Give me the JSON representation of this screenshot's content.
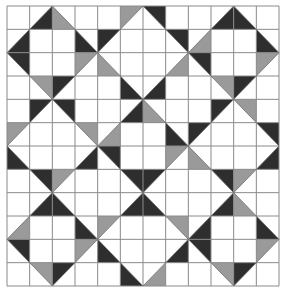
{
  "grid": {
    "rows": 12,
    "cols": 12
  },
  "colors": {
    "background": "#ffffff",
    "grid_line": "#8a8a8a",
    "dark": "#2e2e2e",
    "gray": "#9a9a9a",
    "outline": "#6e6e6e"
  },
  "triangles": [
    {
      "r": 0,
      "c": 1,
      "corner": "BR",
      "tone": "dark"
    },
    {
      "r": 0,
      "c": 2,
      "corner": "BL",
      "tone": "gray"
    },
    {
      "r": 0,
      "c": 5,
      "corner": "TL",
      "tone": "gray"
    },
    {
      "r": 0,
      "c": 6,
      "corner": "TR",
      "tone": "dark"
    },
    {
      "r": 0,
      "c": 9,
      "corner": "BR",
      "tone": "dark"
    },
    {
      "r": 0,
      "c": 10,
      "corner": "BL",
      "tone": "dark"
    },
    {
      "r": 1,
      "c": 0,
      "corner": "BR",
      "tone": "dark"
    },
    {
      "r": 1,
      "c": 3,
      "corner": "BL",
      "tone": "dark"
    },
    {
      "r": 1,
      "c": 4,
      "corner": "TL",
      "tone": "dark"
    },
    {
      "r": 1,
      "c": 7,
      "corner": "TR",
      "tone": "dark"
    },
    {
      "r": 1,
      "c": 8,
      "corner": "BR",
      "tone": "gray"
    },
    {
      "r": 1,
      "c": 11,
      "corner": "BL",
      "tone": "dark"
    },
    {
      "r": 2,
      "c": 0,
      "corner": "TR",
      "tone": "dark"
    },
    {
      "r": 2,
      "c": 3,
      "corner": "TL",
      "tone": "gray"
    },
    {
      "r": 2,
      "c": 4,
      "corner": "BL",
      "tone": "gray"
    },
    {
      "r": 2,
      "c": 7,
      "corner": "BR",
      "tone": "gray"
    },
    {
      "r": 2,
      "c": 8,
      "corner": "TR",
      "tone": "dark"
    },
    {
      "r": 2,
      "c": 11,
      "corner": "TL",
      "tone": "gray"
    },
    {
      "r": 3,
      "c": 1,
      "corner": "TR",
      "tone": "gray"
    },
    {
      "r": 3,
      "c": 2,
      "corner": "TL",
      "tone": "dark"
    },
    {
      "r": 3,
      "c": 5,
      "corner": "BL",
      "tone": "dark"
    },
    {
      "r": 3,
      "c": 6,
      "corner": "BR",
      "tone": "dark"
    },
    {
      "r": 3,
      "c": 9,
      "corner": "TR",
      "tone": "gray"
    },
    {
      "r": 3,
      "c": 10,
      "corner": "TL",
      "tone": "dark"
    },
    {
      "r": 4,
      "c": 1,
      "corner": "TL",
      "tone": "dark"
    },
    {
      "r": 4,
      "c": 2,
      "corner": "TR",
      "tone": "dark"
    },
    {
      "r": 4,
      "c": 5,
      "corner": "BR",
      "tone": "dark"
    },
    {
      "r": 4,
      "c": 6,
      "corner": "BL",
      "tone": "gray"
    },
    {
      "r": 4,
      "c": 9,
      "corner": "TL",
      "tone": "dark"
    },
    {
      "r": 4,
      "c": 10,
      "corner": "TR",
      "tone": "gray"
    },
    {
      "r": 5,
      "c": 0,
      "corner": "TL",
      "tone": "gray"
    },
    {
      "r": 5,
      "c": 3,
      "corner": "TR",
      "tone": "gray"
    },
    {
      "r": 5,
      "c": 4,
      "corner": "BR",
      "tone": "gray"
    },
    {
      "r": 5,
      "c": 7,
      "corner": "BL",
      "tone": "dark"
    },
    {
      "r": 5,
      "c": 8,
      "corner": "TL",
      "tone": "dark"
    },
    {
      "r": 5,
      "c": 11,
      "corner": "TR",
      "tone": "dark"
    },
    {
      "r": 6,
      "c": 0,
      "corner": "BL",
      "tone": "dark"
    },
    {
      "r": 6,
      "c": 3,
      "corner": "BR",
      "tone": "dark"
    },
    {
      "r": 6,
      "c": 4,
      "corner": "TR",
      "tone": "dark"
    },
    {
      "r": 6,
      "c": 7,
      "corner": "TL",
      "tone": "gray"
    },
    {
      "r": 6,
      "c": 8,
      "corner": "BL",
      "tone": "gray"
    },
    {
      "r": 6,
      "c": 11,
      "corner": "BR",
      "tone": "dark"
    },
    {
      "r": 7,
      "c": 1,
      "corner": "TR",
      "tone": "dark"
    },
    {
      "r": 7,
      "c": 2,
      "corner": "TL",
      "tone": "gray"
    },
    {
      "r": 7,
      "c": 5,
      "corner": "TR",
      "tone": "dark"
    },
    {
      "r": 7,
      "c": 6,
      "corner": "TL",
      "tone": "dark"
    },
    {
      "r": 7,
      "c": 9,
      "corner": "TR",
      "tone": "dark"
    },
    {
      "r": 7,
      "c": 10,
      "corner": "TL",
      "tone": "gray"
    },
    {
      "r": 8,
      "c": 1,
      "corner": "BR",
      "tone": "dark"
    },
    {
      "r": 8,
      "c": 2,
      "corner": "BL",
      "tone": "dark"
    },
    {
      "r": 8,
      "c": 5,
      "corner": "BR",
      "tone": "dark"
    },
    {
      "r": 8,
      "c": 6,
      "corner": "BL",
      "tone": "dark"
    },
    {
      "r": 8,
      "c": 9,
      "corner": "BR",
      "tone": "dark"
    },
    {
      "r": 8,
      "c": 10,
      "corner": "BL",
      "tone": "gray"
    },
    {
      "r": 9,
      "c": 0,
      "corner": "BR",
      "tone": "gray"
    },
    {
      "r": 9,
      "c": 3,
      "corner": "BL",
      "tone": "dark"
    },
    {
      "r": 9,
      "c": 4,
      "corner": "TL",
      "tone": "gray"
    },
    {
      "r": 9,
      "c": 7,
      "corner": "TR",
      "tone": "gray"
    },
    {
      "r": 9,
      "c": 8,
      "corner": "BR",
      "tone": "dark"
    },
    {
      "r": 9,
      "c": 11,
      "corner": "BL",
      "tone": "dark"
    },
    {
      "r": 10,
      "c": 0,
      "corner": "TR",
      "tone": "dark"
    },
    {
      "r": 10,
      "c": 3,
      "corner": "TL",
      "tone": "gray"
    },
    {
      "r": 10,
      "c": 4,
      "corner": "BL",
      "tone": "dark"
    },
    {
      "r": 10,
      "c": 7,
      "corner": "BR",
      "tone": "dark"
    },
    {
      "r": 10,
      "c": 8,
      "corner": "TR",
      "tone": "dark"
    },
    {
      "r": 10,
      "c": 11,
      "corner": "TL",
      "tone": "gray"
    },
    {
      "r": 11,
      "c": 1,
      "corner": "TR",
      "tone": "gray"
    },
    {
      "r": 11,
      "c": 2,
      "corner": "TL",
      "tone": "dark"
    },
    {
      "r": 11,
      "c": 5,
      "corner": "BL",
      "tone": "dark"
    },
    {
      "r": 11,
      "c": 6,
      "corner": "BR",
      "tone": "gray"
    },
    {
      "r": 11,
      "c": 9,
      "corner": "TR",
      "tone": "gray"
    },
    {
      "r": 11,
      "c": 10,
      "corner": "TL",
      "tone": "dark"
    }
  ]
}
